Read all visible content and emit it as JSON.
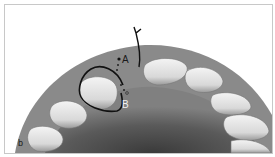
{
  "figure": {
    "panel_label": "b",
    "point_labels": {
      "a": "A",
      "b": "B"
    },
    "colors": {
      "background": "#ffffff",
      "gingiva": "#7a7a7a",
      "palate_shadow": "#4a4a4a",
      "tooth": "#e8e8e8",
      "tooth_shadow": "#9a9a9a",
      "outline": "#111111"
    }
  }
}
